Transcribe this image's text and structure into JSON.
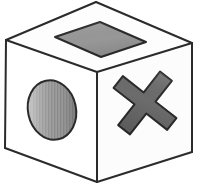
{
  "illustration": {
    "title": "Cube with symbols",
    "background_color": "#ffffff",
    "object_name": "die-cube",
    "outline_color": "#2b2b2b",
    "outline_width": 2.0
  },
  "cube": {
    "name": "three-quarter-view-cube",
    "faces": [
      {
        "id": "top",
        "name": "cube-top-face",
        "fill_color": "#fdfdfd",
        "points": "96,2 192,43 97,72 6,40"
      },
      {
        "id": "left",
        "name": "cube-left-face",
        "fill_color": "#ffffff",
        "points": "6,40 97,72 97,182 5,148"
      },
      {
        "id": "right",
        "name": "cube-right-face",
        "fill_color": "#fcfcfc",
        "points": "97,72 192,43 192,152 97,182"
      }
    ],
    "edges": [
      {
        "name": "edge-top-left",
        "x1": 6,
        "y1": 40,
        "x2": 96,
        "y2": 2
      },
      {
        "name": "edge-top-right",
        "x1": 96,
        "y1": 2,
        "x2": 192,
        "y2": 43
      },
      {
        "name": "edge-top-front-left",
        "x1": 6,
        "y1": 40,
        "x2": 97,
        "y2": 72
      },
      {
        "name": "edge-top-front-right",
        "x1": 97,
        "y1": 72,
        "x2": 192,
        "y2": 43
      },
      {
        "name": "edge-vertical-front",
        "x1": 97,
        "y1": 72,
        "x2": 97,
        "y2": 182
      },
      {
        "name": "edge-vertical-left",
        "x1": 6,
        "y1": 40,
        "x2": 5,
        "y2": 148
      },
      {
        "name": "edge-vertical-right",
        "x1": 192,
        "y1": 43,
        "x2": 192,
        "y2": 152
      },
      {
        "name": "edge-bottom-left",
        "x1": 5,
        "y1": 148,
        "x2": 97,
        "y2": 182
      },
      {
        "name": "edge-bottom-right",
        "x1": 97,
        "y1": 182,
        "x2": 192,
        "y2": 152
      }
    ]
  },
  "symbols": {
    "top_diamond": {
      "name": "diamond-symbol",
      "shape": "diamond",
      "face": "top",
      "fill_color": "#9c9c9c",
      "stroke_color": "#2b2b2b",
      "points": "100,22 146,42 101,57 55,37"
    },
    "left_ellipse": {
      "name": "ellipse-symbol",
      "shape": "ellipse",
      "face": "left",
      "fill_color": "#909090",
      "highlight_color": "#cfcfcf",
      "shadow_color": "#6e6e6e",
      "stroke_color": "#2b2b2b",
      "cx": 52,
      "cy": 110,
      "rx": 24,
      "ry": 30,
      "rotation_deg": -12,
      "texture": "vertical-stripes"
    },
    "right_cross": {
      "name": "cross-symbol",
      "shape": "x-cross",
      "face": "right",
      "fill_color": "#6e6e6e",
      "stroke_color": "#2b2b2b",
      "cx": 145,
      "cy": 103,
      "arm_length": 34,
      "arm_width": 15,
      "rotation_deg": 38
    }
  }
}
